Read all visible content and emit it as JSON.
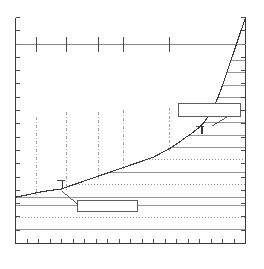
{
  "figure": {
    "background_color": "#ffffff",
    "line_color": "#3a3a3a",
    "grid_color": "#7a7a7a",
    "dash_color": "#8c8c8c",
    "box_color": "#4a4a4a",
    "width": 264,
    "height": 269
  },
  "labels": {
    "title": "",
    "subtitle": "",
    "xlabel": "",
    "ylabel": "",
    "callout_lower_text": "",
    "callout_upper_text": ""
  },
  "chart_data": {
    "type": "line",
    "title": "",
    "subtitle": "",
    "xlabel": "",
    "ylabel": "",
    "xlim": [
      0,
      100
    ],
    "ylim": [
      0,
      100
    ],
    "grid": true,
    "legend": false,
    "legend_position": "none",
    "series": [
      {
        "name": "cumulative-curve",
        "x": [
          0.0,
          4.0,
          8.0,
          12.0,
          16.0,
          20.0,
          24.0,
          28.0,
          32.0,
          36.0,
          40.0,
          44.0,
          48.0,
          52.0,
          56.0,
          60.0,
          64.0,
          68.0,
          72.0,
          74.0,
          76.0,
          78.0,
          80.0,
          82.0,
          84.0,
          86.0,
          88.0,
          90.0,
          92.0,
          94.0,
          96.0,
          97.0,
          98.0,
          99.0,
          100.0
        ],
        "y": [
          20.5,
          21.3,
          22.2,
          23.0,
          23.6,
          24.1,
          25.6,
          27.0,
          28.4,
          29.8,
          31.2,
          32.6,
          34.0,
          35.4,
          36.8,
          38.2,
          40.4,
          42.6,
          45.4,
          47.0,
          48.2,
          49.9,
          51.4,
          53.6,
          56.5,
          60.0,
          64.5,
          70.0,
          76.0,
          82.0,
          88.0,
          91.0,
          94.0,
          97.0,
          100.0
        ]
      }
    ],
    "axes": {
      "top_rule_y": 88.0,
      "bottom_tick_count": 20,
      "left_tick_count": 17,
      "right_tick_count": 17,
      "top_tick_count": 5,
      "top_tick_x": [
        9.0,
        22.0,
        36.0,
        47.0,
        67.0
      ]
    },
    "gridlines": {
      "horizontal_y": [
        6.0,
        11.5,
        17.0,
        20.5,
        26.0,
        31.5,
        37.0,
        42.5,
        48.0,
        53.5,
        59.0,
        64.5,
        70.0,
        75.5,
        81.0
      ],
      "horizontal_style": [
        "solid",
        "dotted",
        "solid",
        "solid",
        "dotted",
        "solid",
        "dotted",
        "solid",
        "solid",
        "solid",
        "solid",
        "solid",
        "solid",
        "solid",
        "solid"
      ]
    },
    "construction_lines": {
      "style": "dash-dot",
      "vertical_x": [
        9.0,
        22.0,
        36.0,
        47.0,
        67.0
      ],
      "top_y": [
        56.0,
        58.0,
        58.0,
        59.0,
        60.0
      ],
      "bottom_y": [
        21.0,
        23.5,
        28.0,
        32.0,
        41.0
      ]
    },
    "annotations": [
      {
        "name": "callout-lower",
        "text": "",
        "box": {
          "x": 27.0,
          "y": 14.0,
          "width": 26.0,
          "height": 5.0
        },
        "leader_from": {
          "x": 27.0,
          "y": 17.0
        },
        "leader_to": {
          "x": 20.0,
          "y": 23.0
        },
        "tick_marker": {
          "x": 20.5,
          "y": 25.5
        }
      },
      {
        "name": "callout-upper",
        "text": "",
        "box": {
          "x": 71.0,
          "y": 56.0,
          "width": 27.0,
          "height": 6.0
        },
        "leader_from": {
          "x": 92.0,
          "y": 56.0
        },
        "leader_to": {
          "x": 85.5,
          "y": 52.0
        },
        "tick_marker": {
          "x": 81.0,
          "y": 49.5
        }
      }
    ]
  }
}
